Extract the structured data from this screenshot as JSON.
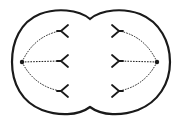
{
  "diagram": {
    "colors": {
      "stroke": "#1a1a1a",
      "background": "#ffffff"
    },
    "cell": {
      "shape": "pinched-double-lobe-membrane"
    },
    "poles": [
      {
        "id": "left-pole",
        "x": 22,
        "y": 62
      },
      {
        "id": "right-pole",
        "x": 157,
        "y": 62
      }
    ],
    "chromosomes": {
      "left": [
        {
          "x": 62,
          "y": 31
        },
        {
          "x": 62,
          "y": 61
        },
        {
          "x": 62,
          "y": 91
        }
      ],
      "right": [
        {
          "x": 117,
          "y": 31
        },
        {
          "x": 117,
          "y": 61
        },
        {
          "x": 117,
          "y": 91
        }
      ]
    },
    "spindle_fibers": "dashed"
  }
}
